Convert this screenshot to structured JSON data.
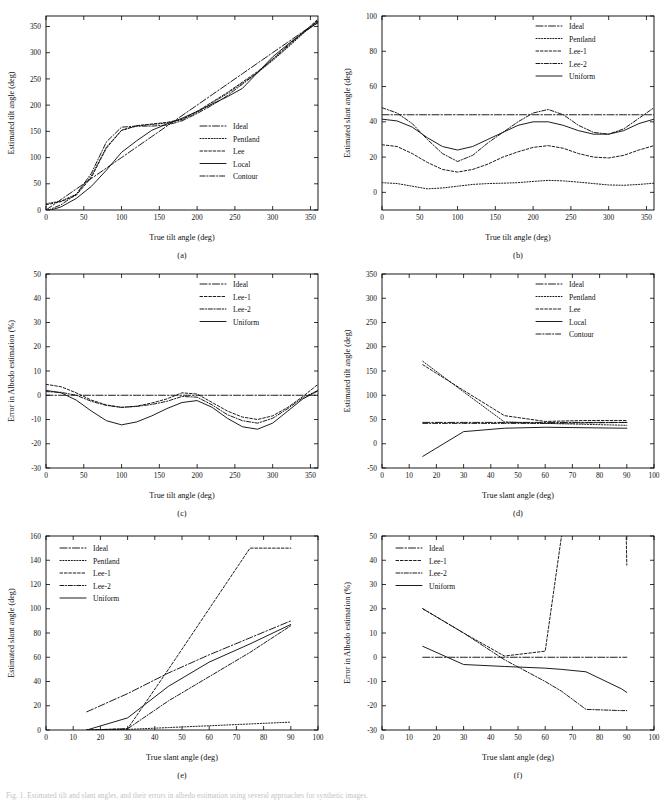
{
  "figure": {
    "caption_fragment": "Fig. 1.  Estimated tilt and slant angles, and their errors in albedo estimation using several approaches for synthetic images.",
    "panel_labels": [
      "(a)",
      "(b)",
      "(c)",
      "(d)",
      "(e)",
      "(f)"
    ]
  },
  "styles": {
    "Ideal": {
      "dash": "7,2,1.5,2"
    },
    "Pentland": {
      "dash": "1.2,1.6"
    },
    "Lee": {
      "dash": "2.6,1.8"
    },
    "Lee-1": {
      "dash": "2.6,1.8"
    },
    "Lee-2": {
      "dash": "4,1.6,1.2,1.6"
    },
    "Local": {
      "dash": "none"
    },
    "Uniform": {
      "dash": "none"
    },
    "Contour": {
      "dash": "5,1.8,1.2,1.8"
    }
  },
  "chart_data": [
    {
      "id": "a",
      "label": "(a)",
      "type": "line",
      "title": "",
      "xlabel": "True tilt angle (deg)",
      "ylabel": "Estimated tilt angle (deg)",
      "xlim": [
        0,
        360
      ],
      "ylim": [
        0,
        370
      ],
      "xticks": [
        0,
        50,
        100,
        150,
        200,
        250,
        300,
        350
      ],
      "yticks": [
        0,
        50,
        100,
        150,
        200,
        250,
        300,
        350
      ],
      "grid": false,
      "legend_position": "center-right",
      "legend": [
        "Ideal",
        "Pentland",
        "Lee",
        "Local",
        "Contour"
      ],
      "x": [
        0,
        20,
        40,
        60,
        80,
        100,
        120,
        140,
        160,
        180,
        200,
        220,
        240,
        260,
        280,
        300,
        320,
        340,
        360
      ],
      "series": [
        {
          "name": "Ideal",
          "values": [
            0,
            20,
            40,
            60,
            80,
            100,
            120,
            140,
            160,
            180,
            200,
            220,
            240,
            260,
            280,
            300,
            320,
            340,
            360
          ]
        },
        {
          "name": "Pentland",
          "values": [
            12,
            17,
            30,
            65,
            120,
            152,
            160,
            163,
            166,
            172,
            186,
            204,
            222,
            242,
            262,
            285,
            310,
            336,
            362
          ]
        },
        {
          "name": "Lee",
          "values": [
            10,
            16,
            28,
            62,
            118,
            152,
            161,
            164,
            167,
            173,
            188,
            206,
            224,
            244,
            264,
            287,
            312,
            338,
            364
          ]
        },
        {
          "name": "Local",
          "values": [
            -3,
            6,
            22,
            45,
            76,
            110,
            132,
            152,
            164,
            175,
            188,
            202,
            216,
            232,
            262,
            292,
            316,
            338,
            358
          ]
        },
        {
          "name": "Contour",
          "values": [
            -2,
            10,
            30,
            70,
            130,
            158,
            160,
            160,
            162,
            170,
            184,
            200,
            218,
            240,
            262,
            288,
            314,
            338,
            357
          ]
        }
      ]
    },
    {
      "id": "b",
      "label": "(b)",
      "type": "line",
      "title": "",
      "xlabel": "True tilt angle (deg)",
      "ylabel": "Estimated slant angle (deg)",
      "xlim": [
        0,
        360
      ],
      "ylim": [
        -10,
        100
      ],
      "xticks": [
        0,
        50,
        100,
        150,
        200,
        250,
        300,
        350
      ],
      "yticks": [
        0,
        20,
        40,
        60,
        80,
        100
      ],
      "grid": false,
      "legend_position": "top-right",
      "legend": [
        "Ideal",
        "Pentland",
        "Lee-1",
        "Lee-2",
        "Uniform"
      ],
      "x": [
        0,
        20,
        40,
        60,
        80,
        100,
        120,
        140,
        160,
        180,
        200,
        220,
        240,
        260,
        280,
        300,
        320,
        340,
        360
      ],
      "series": [
        {
          "name": "Ideal",
          "values": [
            44,
            44,
            44,
            44,
            44,
            44,
            44,
            44,
            44,
            44,
            44,
            44,
            44,
            44,
            44,
            44,
            44,
            44,
            44
          ]
        },
        {
          "name": "Pentland",
          "values": [
            5.5,
            5.0,
            3.5,
            2.0,
            2.5,
            3.5,
            4.5,
            5.0,
            5.2,
            5.5,
            6.2,
            6.8,
            6.5,
            5.8,
            5.0,
            4.2,
            4.0,
            4.5,
            5.2
          ]
        },
        {
          "name": "Lee-1",
          "values": [
            27,
            26,
            22,
            17,
            13,
            11.5,
            13,
            16,
            20,
            23,
            25.5,
            26.5,
            25,
            22,
            20,
            19.5,
            21,
            24,
            26.5
          ]
        },
        {
          "name": "Lee-2",
          "values": [
            48,
            45,
            39,
            30,
            22,
            17.5,
            21,
            28,
            34,
            40,
            45,
            47,
            44,
            38,
            34,
            33,
            36,
            42,
            48
          ]
        },
        {
          "name": "Uniform",
          "values": [
            41.5,
            40.5,
            37,
            31,
            26,
            24,
            26,
            30,
            34,
            38,
            40,
            40,
            38,
            35,
            33,
            33,
            35,
            39,
            41.5
          ]
        }
      ]
    },
    {
      "id": "c",
      "label": "(c)",
      "type": "line",
      "title": "",
      "xlabel": "True tilt angle (deg)",
      "ylabel": "Error in Albedo estimation (%)",
      "xlim": [
        0,
        360
      ],
      "ylim": [
        -30,
        50
      ],
      "xticks": [
        0,
        50,
        100,
        150,
        200,
        250,
        300,
        350
      ],
      "yticks": [
        -30,
        -20,
        -10,
        0,
        10,
        20,
        30,
        40,
        50
      ],
      "grid": false,
      "legend_position": "top-right",
      "legend": [
        "Ideal",
        "Lee-1",
        "Lee-2",
        "Uniform"
      ],
      "x": [
        0,
        20,
        40,
        60,
        80,
        100,
        120,
        140,
        160,
        180,
        200,
        220,
        240,
        260,
        280,
        300,
        320,
        340,
        360
      ],
      "series": [
        {
          "name": "Ideal",
          "values": [
            0,
            0,
            0,
            0,
            0,
            0,
            0,
            0,
            0,
            0,
            0,
            0,
            0,
            0,
            0,
            0,
            0,
            0,
            0
          ]
        },
        {
          "name": "Lee-1",
          "values": [
            4.5,
            3.5,
            1.0,
            -2.0,
            -4.0,
            -5.0,
            -4.5,
            -3.2,
            -1.5,
            1.0,
            0.5,
            -3.0,
            -6.5,
            -9.0,
            -10.0,
            -8.5,
            -5.0,
            -0.5,
            4.5
          ]
        },
        {
          "name": "Lee-2",
          "values": [
            1.5,
            1.2,
            0.0,
            -2.5,
            -4.2,
            -5.0,
            -4.6,
            -3.8,
            -2.5,
            -0.5,
            -0.8,
            -4.0,
            -8.0,
            -10.5,
            -11.5,
            -9.5,
            -5.5,
            -1.0,
            2.0
          ]
        },
        {
          "name": "Uniform",
          "values": [
            2.0,
            1.0,
            -2.0,
            -6.5,
            -10.5,
            -12.2,
            -11.0,
            -8.5,
            -5.5,
            -3.0,
            -2.2,
            -5.0,
            -9.5,
            -13.0,
            -14.0,
            -11.5,
            -6.5,
            -1.5,
            1.8
          ]
        }
      ]
    },
    {
      "id": "d",
      "label": "(d)",
      "type": "line",
      "title": "",
      "xlabel": "True slant angle (deg)",
      "ylabel": "Estimated tilt angle (deg)",
      "xlim": [
        0,
        100
      ],
      "ylim": [
        -50,
        350
      ],
      "xticks": [
        0,
        10,
        20,
        30,
        40,
        50,
        60,
        70,
        80,
        90,
        100
      ],
      "yticks": [
        -50,
        0,
        50,
        100,
        150,
        200,
        250,
        300,
        350
      ],
      "grid": false,
      "legend_position": "top-right",
      "legend": [
        "Ideal",
        "Pentland",
        "Lee",
        "Local",
        "Contour"
      ],
      "x": [
        15,
        30,
        45,
        60,
        75,
        90
      ],
      "series": [
        {
          "name": "Ideal",
          "values": [
            44,
            44,
            44,
            44,
            44,
            44
          ]
        },
        {
          "name": "Pentland",
          "values": [
            170,
            107,
            45,
            42,
            40,
            38
          ]
        },
        {
          "name": "Lee",
          "values": [
            163,
            110,
            58,
            46,
            48,
            48
          ]
        },
        {
          "name": "Local",
          "values": [
            -26,
            25,
            32,
            34,
            33,
            32
          ]
        },
        {
          "name": "Contour",
          "values": [
            42,
            42,
            42,
            42,
            43,
            44
          ]
        }
      ]
    },
    {
      "id": "e",
      "label": "(e)",
      "type": "line",
      "title": "",
      "xlabel": "True slant angle (deg)",
      "ylabel": "Estimated slant angle (deg)",
      "xlim": [
        0,
        100
      ],
      "ylim": [
        0,
        160
      ],
      "xticks": [
        0,
        10,
        20,
        30,
        40,
        50,
        60,
        70,
        80,
        90,
        100
      ],
      "yticks": [
        0,
        20,
        40,
        60,
        80,
        100,
        120,
        140,
        160
      ],
      "grid": false,
      "legend_position": "top-left",
      "legend": [
        "Ideal",
        "Pentland",
        "Lee-1",
        "Lee-2",
        "Uniform"
      ],
      "x": [
        15,
        30,
        45,
        60,
        75,
        90
      ],
      "series": [
        {
          "name": "Ideal",
          "values": [
            15,
            30,
            47,
            62,
            76,
            90
          ]
        },
        {
          "name": "Pentland",
          "values": [
            0,
            0.5,
            2,
            3.5,
            5,
            6.5
          ]
        },
        {
          "name": "Lee-1",
          "values": [
            0,
            1,
            50,
            100,
            150,
            150
          ]
        },
        {
          "name": "Lee-2",
          "values": [
            0,
            1,
            24,
            44,
            64,
            86
          ]
        },
        {
          "name": "Uniform",
          "values": [
            0,
            10,
            36,
            56,
            71,
            87
          ]
        }
      ]
    },
    {
      "id": "f",
      "label": "(f)",
      "type": "line",
      "title": "",
      "xlabel": "True slant angle (deg)",
      "ylabel": "Error in Albedo estimation (%)",
      "xlim": [
        0,
        100
      ],
      "ylim": [
        -30,
        50
      ],
      "xticks": [
        0,
        10,
        20,
        30,
        40,
        50,
        60,
        70,
        80,
        90,
        100
      ],
      "yticks": [
        -30,
        -20,
        -10,
        0,
        10,
        20,
        30,
        40,
        50
      ],
      "grid": false,
      "legend_position": "top-left",
      "legend": [
        "Ideal",
        "Lee-1",
        "Lee-2",
        "Uniform"
      ],
      "x": [
        15,
        30,
        45,
        60,
        66,
        75,
        88,
        90
      ],
      "series": [
        {
          "name": "Ideal",
          "values": [
            0,
            0,
            0,
            0,
            0,
            0,
            0,
            0
          ]
        },
        {
          "name": "Lee-1",
          "values": [
            20,
            10,
            0.5,
            2.5,
            50,
            120,
            150,
            38
          ]
        },
        {
          "name": "Lee-2",
          "values": [
            20,
            10,
            -1,
            -10,
            -14,
            -21.5,
            -22,
            -22
          ]
        },
        {
          "name": "Uniform",
          "values": [
            4.5,
            -3,
            -3.8,
            -4.5,
            -5,
            -6,
            -13,
            -14.5
          ]
        }
      ]
    }
  ]
}
